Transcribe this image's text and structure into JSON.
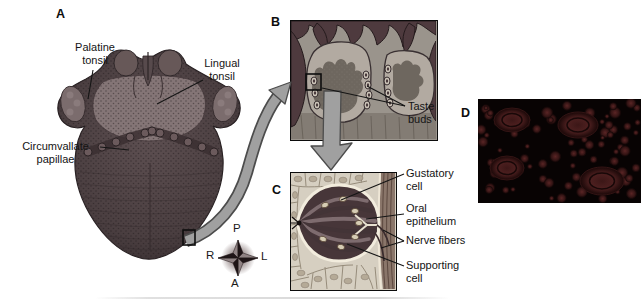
{
  "figure_title": "Tongue and taste bud anatomy figure",
  "panelA": {
    "letter": "A",
    "labels": {
      "palatine_tonsil": "Palatine\ntonsil",
      "lingual_tonsil": "Lingual\ntonsil",
      "circumvallate_papillae": "Circumvallate\npapillae"
    }
  },
  "panelB": {
    "letter": "B",
    "labels": {
      "taste_buds": "Taste\nbuds"
    }
  },
  "panelC": {
    "letter": "C",
    "labels": {
      "gustatory_cell": "Gustatory\ncell",
      "oral_epithelium": "Oral\nepithelium",
      "nerve_fibers": "Nerve fibers",
      "supporting_cell": "Supporting\ncell"
    }
  },
  "panelD": {
    "letter": "D"
  },
  "compass": {
    "posterior": "P",
    "right": "R",
    "left": "L",
    "anterior": "A"
  },
  "colors": {
    "background": "#ffffff",
    "text": "#141414",
    "tongue_body": "#4a3e40",
    "lingual_tonsil_area": "#847576",
    "arrow_gray": "#a0a0a0",
    "arrow_outline": "#4c4c4c",
    "panel_b_background": "#9a948c",
    "panel_b_papilla": "#b2aaa1",
    "panel_b_mucosa_dark": "#4e3a3e",
    "panel_c_background": "#d6cfc1",
    "taste_bud_dark": "#473639",
    "taste_bud_rim": "#f2ecdd",
    "micrograph_background": "#080303",
    "micrograph_papilla": "#3c1717",
    "compass_star": "#1e1416"
  }
}
